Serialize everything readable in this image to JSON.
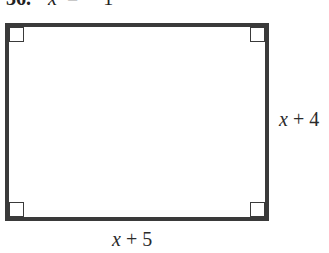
{
  "problem": {
    "number": "36.",
    "variable": "x",
    "equals": "=",
    "value": "1"
  },
  "figure": {
    "shape": "rectangle",
    "right_angle_markers": 4,
    "side_labels": {
      "right": {
        "variable": "x",
        "operator": "+",
        "constant": "4"
      },
      "bottom": {
        "variable": "x",
        "operator": "+",
        "constant": "5"
      }
    },
    "colors": {
      "stroke": "#3a3a3a",
      "text": "#2a2a2a",
      "background": "#ffffff"
    }
  }
}
